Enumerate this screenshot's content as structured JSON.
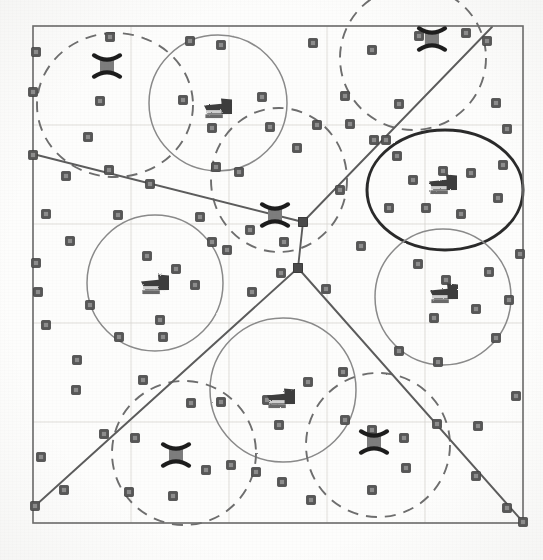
{
  "figure": {
    "caption": "",
    "background_color": "#fdfdfc",
    "ink_color": "#4a4a4a",
    "scan_style": "grayscale photocopy"
  },
  "plot_frame": {
    "label": "plot-border",
    "x": 33,
    "y": 26,
    "width": 490,
    "height": 497,
    "stroke": "#6d6d6d",
    "stroke_width": 1.6
  },
  "grid": {
    "visible": true,
    "stroke": "#d8d6d2",
    "stroke_width": 0.8,
    "vertical_x": [
      33,
      131,
      229,
      327,
      425,
      523
    ],
    "horizontal_y": [
      26,
      125,
      224,
      323,
      422,
      523
    ],
    "columns": 5,
    "rows": 5
  },
  "partition_lines": {
    "label": "voronoi-partition-edges",
    "stroke": "#5c5c5c",
    "stroke_width": 1.9,
    "segments": [
      {
        "name": "edge-west",
        "x1": 33,
        "y1": 154,
        "x2": 303,
        "y2": 222
      },
      {
        "name": "edge-northeast",
        "x1": 303,
        "y1": 222,
        "x2": 492,
        "y2": 27
      },
      {
        "name": "edge-center-vertical",
        "x1": 303,
        "y1": 222,
        "x2": 298,
        "y2": 268
      },
      {
        "name": "edge-southwest",
        "x1": 298,
        "y1": 268,
        "x2": 35,
        "y2": 506
      },
      {
        "name": "edge-southeast",
        "x1": 298,
        "y1": 268,
        "x2": 523,
        "y2": 522
      }
    ],
    "junction_nodes": [
      {
        "name": "junction-upper",
        "x": 303,
        "y": 222
      },
      {
        "name": "junction-lower",
        "x": 298,
        "y": 268
      }
    ]
  },
  "clusters": [
    {
      "name": "cluster-nw-dashed",
      "cx": 115,
      "cy": 105,
      "rx": 78,
      "ry": 72,
      "style": "dashed",
      "stroke": "#6e6e6e",
      "stroke_width": 1.9,
      "emphasis": "normal"
    },
    {
      "name": "cluster-n-solid",
      "cx": 218,
      "cy": 103,
      "rx": 69,
      "ry": 68,
      "style": "solid",
      "stroke": "#8a8a8a",
      "stroke_width": 1.5,
      "emphasis": "normal"
    },
    {
      "name": "cluster-ne-dashed",
      "cx": 413,
      "cy": 58,
      "rx": 73,
      "ry": 72,
      "style": "dashed",
      "stroke": "#6e6e6e",
      "stroke_width": 1.9,
      "emphasis": "normal"
    },
    {
      "name": "cluster-center-dashed",
      "cx": 279,
      "cy": 180,
      "rx": 68,
      "ry": 72,
      "style": "dashed",
      "stroke": "#6e6e6e",
      "stroke_width": 1.9,
      "emphasis": "normal"
    },
    {
      "name": "cluster-east-bold",
      "cx": 445,
      "cy": 190,
      "rx": 78,
      "ry": 60,
      "style": "solid",
      "stroke": "#2b2b2b",
      "stroke_width": 3.0,
      "emphasis": "highlighted"
    },
    {
      "name": "cluster-w-solid",
      "cx": 155,
      "cy": 283,
      "rx": 68,
      "ry": 68,
      "style": "solid",
      "stroke": "#8a8a8a",
      "stroke_width": 1.5,
      "emphasis": "normal"
    },
    {
      "name": "cluster-e-solid",
      "cx": 443,
      "cy": 297,
      "rx": 68,
      "ry": 68,
      "style": "solid",
      "stroke": "#8a8a8a",
      "stroke_width": 1.5,
      "emphasis": "normal"
    },
    {
      "name": "cluster-s-solid",
      "cx": 283,
      "cy": 390,
      "rx": 73,
      "ry": 72,
      "style": "solid",
      "stroke": "#8a8a8a",
      "stroke_width": 1.5,
      "emphasis": "normal"
    },
    {
      "name": "cluster-sw-dashed",
      "cx": 184,
      "cy": 453,
      "rx": 72,
      "ry": 72,
      "style": "dashed",
      "stroke": "#6e6e6e",
      "stroke_width": 1.9,
      "emphasis": "normal"
    },
    {
      "name": "cluster-se-dashed",
      "cx": 378,
      "cy": 445,
      "rx": 72,
      "ry": 72,
      "style": "dashed",
      "stroke": "#6e6e6e",
      "stroke_width": 1.9,
      "emphasis": "normal"
    }
  ],
  "nodes": {
    "label": "sensor-node",
    "marker": "filled-square",
    "fill": "#575757",
    "size": 9,
    "count": 86,
    "points": [
      [
        36,
        52
      ],
      [
        110,
        37
      ],
      [
        190,
        41
      ],
      [
        221,
        45
      ],
      [
        313,
        43
      ],
      [
        372,
        50
      ],
      [
        466,
        33
      ],
      [
        419,
        36
      ],
      [
        487,
        41
      ],
      [
        33,
        92
      ],
      [
        100,
        101
      ],
      [
        183,
        100
      ],
      [
        262,
        97
      ],
      [
        317,
        125
      ],
      [
        345,
        96
      ],
      [
        350,
        124
      ],
      [
        399,
        104
      ],
      [
        496,
        103
      ],
      [
        88,
        137
      ],
      [
        212,
        128
      ],
      [
        270,
        127
      ],
      [
        297,
        148
      ],
      [
        374,
        140
      ],
      [
        507,
        129
      ],
      [
        33,
        155
      ],
      [
        66,
        176
      ],
      [
        109,
        170
      ],
      [
        150,
        184
      ],
      [
        216,
        167
      ],
      [
        239,
        172
      ],
      [
        386,
        140
      ],
      [
        397,
        156
      ],
      [
        413,
        180
      ],
      [
        443,
        171
      ],
      [
        471,
        173
      ],
      [
        503,
        165
      ],
      [
        46,
        214
      ],
      [
        70,
        241
      ],
      [
        118,
        215
      ],
      [
        200,
        217
      ],
      [
        212,
        242
      ],
      [
        250,
        230
      ],
      [
        284,
        242
      ],
      [
        303,
        222
      ],
      [
        340,
        190
      ],
      [
        389,
        208
      ],
      [
        426,
        208
      ],
      [
        461,
        214
      ],
      [
        498,
        198
      ],
      [
        36,
        263
      ],
      [
        147,
        256
      ],
      [
        176,
        269
      ],
      [
        227,
        250
      ],
      [
        281,
        273
      ],
      [
        298,
        268
      ],
      [
        361,
        246
      ],
      [
        418,
        264
      ],
      [
        446,
        280
      ],
      [
        489,
        272
      ],
      [
        520,
        254
      ],
      [
        38,
        292
      ],
      [
        90,
        305
      ],
      [
        160,
        320
      ],
      [
        195,
        285
      ],
      [
        252,
        292
      ],
      [
        326,
        289
      ],
      [
        434,
        318
      ],
      [
        476,
        309
      ],
      [
        509,
        300
      ],
      [
        46,
        325
      ],
      [
        77,
        360
      ],
      [
        119,
        337
      ],
      [
        163,
        337
      ],
      [
        191,
        403
      ],
      [
        221,
        402
      ],
      [
        267,
        400
      ],
      [
        308,
        382
      ],
      [
        343,
        372
      ],
      [
        399,
        351
      ],
      [
        438,
        362
      ],
      [
        496,
        338
      ],
      [
        76,
        390
      ],
      [
        104,
        434
      ],
      [
        135,
        438
      ],
      [
        279,
        425
      ],
      [
        345,
        420
      ],
      [
        372,
        430
      ],
      [
        404,
        438
      ],
      [
        437,
        424
      ],
      [
        478,
        426
      ],
      [
        516,
        396
      ],
      [
        41,
        457
      ],
      [
        64,
        490
      ],
      [
        129,
        492
      ],
      [
        173,
        496
      ],
      [
        206,
        470
      ],
      [
        256,
        472
      ],
      [
        282,
        482
      ],
      [
        311,
        500
      ],
      [
        372,
        490
      ],
      [
        406,
        468
      ],
      [
        476,
        476
      ],
      [
        507,
        508
      ],
      [
        523,
        522
      ],
      [
        35,
        506
      ],
      [
        231,
        465
      ],
      [
        143,
        380
      ]
    ]
  },
  "x_markers": {
    "label": "cluster-head-node",
    "marker": "x-over-square",
    "stroke": "#1f1f1f",
    "stroke_width": 4.2,
    "size": 26,
    "count": 5,
    "points": [
      {
        "name": "head-nw",
        "x": 107,
        "y": 66
      },
      {
        "name": "head-ne",
        "x": 432,
        "y": 39
      },
      {
        "name": "head-center",
        "x": 275,
        "y": 215
      },
      {
        "name": "head-sw",
        "x": 176,
        "y": 455
      },
      {
        "name": "head-se",
        "x": 374,
        "y": 442
      }
    ]
  },
  "blob_markers": {
    "label": "cluster-centroid-glyph",
    "marker": "arrow-blob",
    "fill": "#3d3d3d",
    "width": 30,
    "height": 21,
    "count": 5,
    "points": [
      {
        "name": "centroid-n",
        "x": 218,
        "y": 108
      },
      {
        "name": "centroid-east-bold",
        "x": 443,
        "y": 184
      },
      {
        "name": "centroid-w",
        "x": 155,
        "y": 284
      },
      {
        "name": "centroid-e",
        "x": 444,
        "y": 293
      },
      {
        "name": "centroid-s",
        "x": 281,
        "y": 398
      }
    ]
  },
  "legend": {
    "visible": false,
    "entries": [
      {
        "symbol": "filled-square",
        "label": "node"
      },
      {
        "symbol": "x-over-square",
        "label": "cluster head"
      },
      {
        "symbol": "arrow-blob",
        "label": "centroid"
      },
      {
        "symbol": "dashed-circle",
        "label": "cluster boundary (dashed)"
      },
      {
        "symbol": "solid-circle",
        "label": "cluster boundary (solid)"
      },
      {
        "symbol": "bold-circle",
        "label": "highlighted cluster"
      }
    ]
  },
  "axes": {
    "x_label": "",
    "y_label": "",
    "x_ticks": [],
    "y_ticks": []
  }
}
